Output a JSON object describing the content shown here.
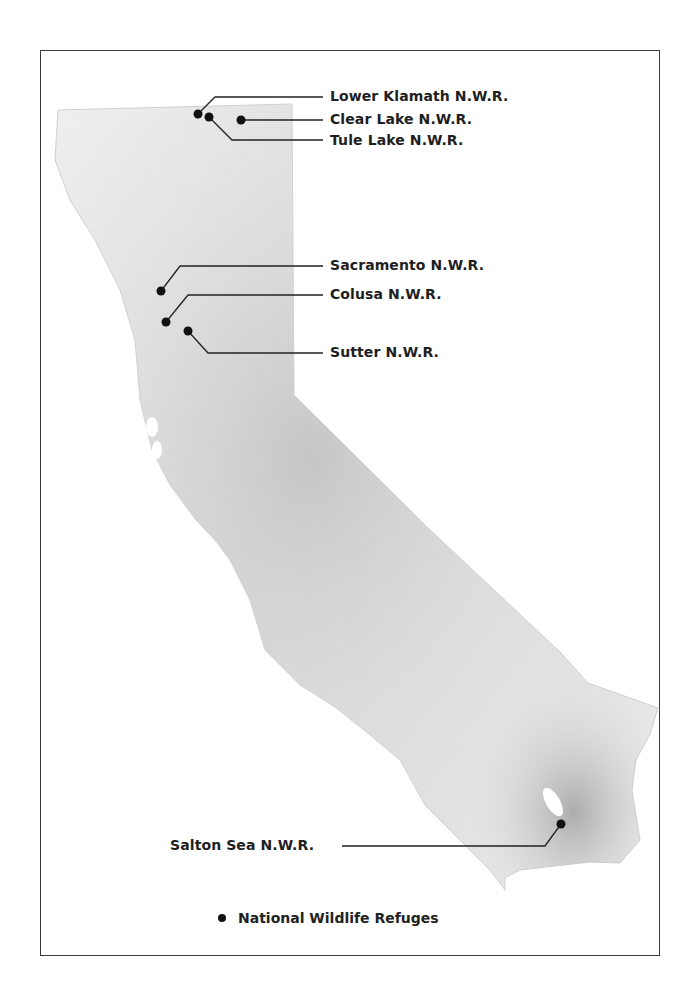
{
  "map": {
    "region": "California",
    "refuges": [
      {
        "id": "lower-klamath",
        "label": "Lower Klamath N.W.R.",
        "x": 198,
        "y": 114,
        "lx": 330,
        "ly": 102
      },
      {
        "id": "clear-lake",
        "label": "Clear Lake N.W.R.",
        "x": 241,
        "y": 120,
        "lx": 330,
        "ly": 121
      },
      {
        "id": "tule-lake",
        "label": "Tule Lake N.W.R.",
        "x": 209,
        "y": 117,
        "lx": 330,
        "ly": 144
      },
      {
        "id": "sacramento",
        "label": "Sacramento N.W.R.",
        "x": 161,
        "y": 291,
        "lx": 330,
        "ly": 262
      },
      {
        "id": "colusa",
        "label": "Colusa N.W.R.",
        "x": 166,
        "y": 322,
        "lx": 330,
        "ly": 287
      },
      {
        "id": "sutter",
        "label": "Sutter N.W.R.",
        "x": 188,
        "y": 331,
        "lx": 330,
        "ly": 350
      },
      {
        "id": "salton-sea",
        "label": "Salton Sea N.W.R.",
        "x": 561,
        "y": 824,
        "lx": 170,
        "ly": 862
      }
    ]
  },
  "legend": {
    "marker": "filled-circle",
    "label": "National Wildlife Refuges"
  },
  "colors": {
    "marker": "#111111",
    "frame": "#3a3a3a",
    "text": "#1e1e1e",
    "land_light": "#f2f2f2",
    "land_dark": "#b8b8b8"
  }
}
